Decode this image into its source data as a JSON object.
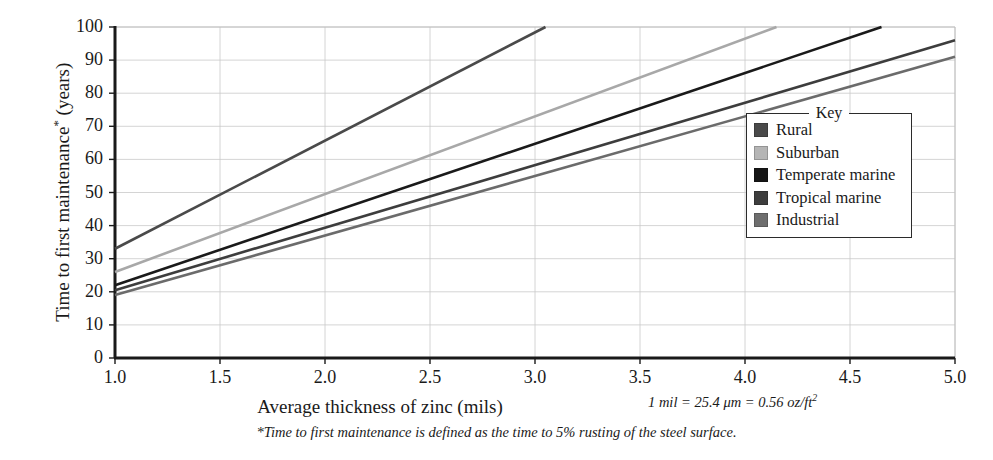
{
  "chart_data": {
    "type": "line",
    "title": "",
    "xlabel": "Average thickness of zinc (mils)",
    "ylabel": "Time to first maintenance* (years)",
    "xlim": [
      1.0,
      5.0
    ],
    "ylim": [
      0,
      100
    ],
    "xticks": [
      "1.0",
      "1.5",
      "2.0",
      "2.5",
      "3.0",
      "3.5",
      "4.0",
      "4.5",
      "5.0"
    ],
    "xtick_values": [
      1.0,
      1.5,
      2.0,
      2.5,
      3.0,
      3.5,
      4.0,
      4.5,
      5.0
    ],
    "yticks": [
      "0",
      "10",
      "20",
      "30",
      "40",
      "50",
      "60",
      "70",
      "80",
      "90",
      "100"
    ],
    "ytick_values": [
      0,
      10,
      20,
      30,
      40,
      50,
      60,
      70,
      80,
      90,
      100
    ],
    "grid": true,
    "legend_position": "right-inside",
    "legend_title": "Key",
    "series": [
      {
        "name": "Rural",
        "color": "#4a4a4a",
        "x": [
          1.0,
          3.05
        ],
        "y": [
          33,
          100
        ]
      },
      {
        "name": "Suburban",
        "color": "#a8a8a8",
        "x": [
          1.0,
          4.15
        ],
        "y": [
          26,
          100
        ]
      },
      {
        "name": "Temperate marine",
        "color": "#1a1a1a",
        "x": [
          1.0,
          4.65
        ],
        "y": [
          22,
          100
        ]
      },
      {
        "name": "Tropical marine",
        "color": "#3d3d3d",
        "x": [
          1.0,
          5.0
        ],
        "y": [
          20.5,
          96
        ]
      },
      {
        "name": "Industrial",
        "color": "#6b6b6b",
        "x": [
          1.0,
          5.0
        ],
        "y": [
          19,
          91
        ]
      }
    ],
    "annotations": [
      "1 mil = 25.4 μm = 0.56 oz/ft²",
      "*Time to first maintenance is defined as the time to 5% rusting of the steel surface."
    ]
  },
  "axes": {
    "x_title": "Average thickness of zinc (mils)",
    "y_title_main": "Time to first maintenance",
    "y_title_star": "*",
    "y_title_unit": " (years)"
  },
  "notes": {
    "unit_conversion_prefix": "1 mil = 25.4 ",
    "unit_conversion_mu": "μm",
    "unit_conversion_mid": " = 0.56 oz/ft",
    "unit_conversion_sup": "2",
    "footnote": "*Time to first maintenance is defined as the time to 5% rusting of the steel surface."
  },
  "legend": {
    "title": "Key",
    "items": [
      {
        "label": "Rural",
        "color": "#4a4a4a"
      },
      {
        "label": "Suburban",
        "color": "#b5b5b5"
      },
      {
        "label": "Temperate marine",
        "color": "#161616"
      },
      {
        "label": "Tropical marine",
        "color": "#3d3d3d"
      },
      {
        "label": "Industrial",
        "color": "#6e6e6e"
      }
    ]
  },
  "geometry": {
    "plot_left": 115,
    "plot_right": 955,
    "plot_top": 27,
    "plot_bottom": 358
  }
}
